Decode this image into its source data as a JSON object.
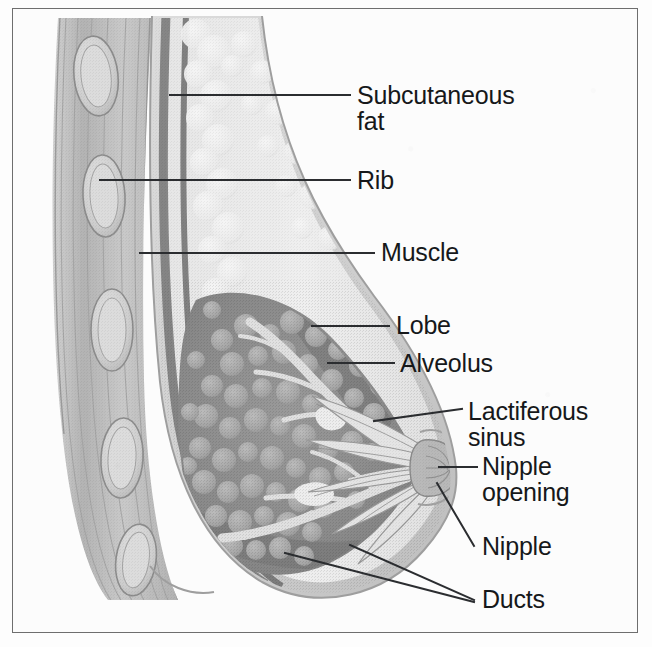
{
  "figure": {
    "frame_color": "#6e6e6e",
    "background_color": "#fcfcfc",
    "leader_line_color": "#2b2d30",
    "label_text_color": "#16181a"
  },
  "labels": [
    {
      "id": "subcutaneous-fat",
      "text": "Subcutaneous\nfat",
      "x": 357,
      "y": 82
    },
    {
      "id": "rib",
      "text": "Rib",
      "x": 357,
      "y": 167
    },
    {
      "id": "muscle",
      "text": "Muscle",
      "x": 381,
      "y": 239
    },
    {
      "id": "lobe",
      "text": "Lobe",
      "x": 396,
      "y": 312
    },
    {
      "id": "alveolus",
      "text": "Alveolus",
      "x": 400,
      "y": 350
    },
    {
      "id": "lactiferous-sinus",
      "text": "Lactiferous\nsinus",
      "x": 468,
      "y": 398
    },
    {
      "id": "nipple-opening",
      "text": "Nipple\nopening",
      "x": 482,
      "y": 453
    },
    {
      "id": "nipple",
      "text": "Nipple",
      "x": 482,
      "y": 533
    },
    {
      "id": "ducts",
      "text": "Ducts",
      "x": 482,
      "y": 586
    }
  ],
  "leader_lines": [
    {
      "id": "leader-subcutaneous-fat",
      "x1": 170,
      "y1": 95,
      "x2": 350,
      "y2": 95
    },
    {
      "id": "leader-rib",
      "x1": 100,
      "y1": 180,
      "x2": 350,
      "y2": 180
    },
    {
      "id": "leader-muscle",
      "x1": 140,
      "y1": 253,
      "x2": 374,
      "y2": 253
    },
    {
      "id": "leader-lobe",
      "x1": 312,
      "y1": 326,
      "x2": 389,
      "y2": 326
    },
    {
      "id": "leader-alveolus",
      "x1": 328,
      "y1": 363,
      "x2": 394,
      "y2": 363
    },
    {
      "id": "leader-lactiferous-sinus",
      "x1": 374,
      "y1": 421,
      "x2": 462,
      "y2": 409
    },
    {
      "id": "leader-nipple-opening",
      "x1": 439,
      "y1": 467,
      "x2": 477,
      "y2": 467
    },
    {
      "id": "leader-nipple",
      "x1": 437,
      "y1": 483,
      "x2": 474,
      "y2": 546
    },
    {
      "id": "leader-ducts-upper",
      "x1": 350,
      "y1": 545,
      "x2": 474,
      "y2": 600
    },
    {
      "id": "leader-ducts-lower",
      "x1": 285,
      "y1": 553,
      "x2": 474,
      "y2": 602
    }
  ],
  "anatomy_regions": [
    {
      "id": "chest-wall-muscle",
      "name": "Chest wall muscle layer",
      "tone": "#bdbdbd"
    },
    {
      "id": "ribs",
      "name": "Ribs (cross sections)",
      "tone": "#cfcfcf",
      "count": 4
    },
    {
      "id": "fascia-line",
      "name": "Deep fascia / pectoral line",
      "tone": "#8a8a8a"
    },
    {
      "id": "subcutaneous-fat",
      "name": "Subcutaneous fat",
      "tone": "#e8e8e8"
    },
    {
      "id": "skin",
      "name": "Skin envelope",
      "tone": "#d6d6d6"
    },
    {
      "id": "glandular-lobes",
      "name": "Glandular lobes",
      "tone": "#8e8e8e"
    },
    {
      "id": "alveoli",
      "name": "Alveoli clusters",
      "tone": "#a8a8a8"
    },
    {
      "id": "ducts",
      "name": "Lactiferous ducts",
      "tone": "#dcdcdc"
    },
    {
      "id": "lactiferous-sinus",
      "name": "Lactiferous sinuses",
      "tone": "#e2e2e2"
    },
    {
      "id": "nipple",
      "name": "Nipple",
      "tone": "#b8b8b8"
    }
  ]
}
